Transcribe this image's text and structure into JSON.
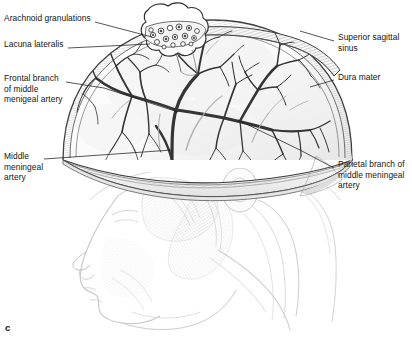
{
  "figure": {
    "caption_letter": "c",
    "view": "left lateral view of head with calvaria removed"
  },
  "labels": {
    "left": [
      {
        "id": "arachnoid-granulations",
        "text": "Arachnoid granulations",
        "x": 4,
        "y": 18,
        "leader": {
          "x1": 95,
          "y1": 22,
          "x2": 152,
          "y2": 37
        }
      },
      {
        "id": "lacuna-lateralis",
        "text": "Lacuna lateralis",
        "x": 4,
        "y": 44,
        "leader": {
          "x1": 68,
          "y1": 48,
          "x2": 150,
          "y2": 44
        }
      },
      {
        "id": "frontal-branch-middle-meningeal-artery",
        "text": "Frontal branch\nof middle\nmenigeal artery",
        "x": 4,
        "y": 78,
        "leader": {
          "x1": 66,
          "y1": 82,
          "x2": 102,
          "y2": 88
        }
      },
      {
        "id": "middle-meningeal-artery",
        "text": "Middle\nmeningeal\nartery",
        "x": 4,
        "y": 155,
        "leader": {
          "x1": 44,
          "y1": 159,
          "x2": 172,
          "y2": 144
        }
      }
    ],
    "right": [
      {
        "id": "superior-sagittal-sinus",
        "text": "Superior sagittal\nsinus",
        "x": 338,
        "y": 36,
        "leader": {
          "x1": 334,
          "y1": 41,
          "x2": 307,
          "y2": 32
        }
      },
      {
        "id": "dura-mater",
        "text": "Dura mater",
        "x": 338,
        "y": 76,
        "leader": {
          "x1": 334,
          "y1": 80,
          "x2": 312,
          "y2": 87
        }
      },
      {
        "id": "parietal-branch-middle-meningeal-artery",
        "text": "Parietal branch of\nmiddle meningeal\nartery",
        "x": 338,
        "y": 163,
        "leader": {
          "x1": 334,
          "y1": 168,
          "x2": 270,
          "y2": 118
        }
      }
    ]
  },
  "colors": {
    "ink": "#141414",
    "vessel": "#3a3a3a",
    "vessel_light": "#8d8d8d",
    "dura_shade": "#d8d8d8",
    "bone_rim": "#efefef",
    "ghost_head": "#c9c9c9",
    "background": "#ffffff"
  }
}
